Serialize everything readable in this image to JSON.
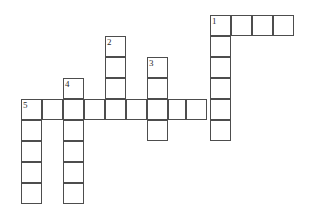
{
  "puzzle": {
    "title": "Crossword Grid",
    "grid": {
      "cell_size": 21,
      "origin_x": 21,
      "origin_y": 15,
      "columns": 14,
      "rows": 10,
      "border_color": "#4d4d4d",
      "cell_fill": "#ffffff",
      "background": "#ffffff",
      "number_color": "#2b2b2b"
    },
    "entries": [
      {
        "number": "1",
        "direction": "across",
        "start_col": 9,
        "start_row": 0,
        "length": 4
      },
      {
        "number": "1",
        "direction": "down",
        "start_col": 9,
        "start_row": 0,
        "length": 6
      },
      {
        "number": "2",
        "direction": "down",
        "start_col": 4,
        "start_row": 1,
        "length": 4
      },
      {
        "number": "3",
        "direction": "down",
        "start_col": 6,
        "start_row": 2,
        "length": 4
      },
      {
        "number": "4",
        "direction": "down",
        "start_col": 2,
        "start_row": 3,
        "length": 7
      },
      {
        "number": "5",
        "direction": "down",
        "start_col": 0,
        "start_row": 4,
        "length": 5
      },
      {
        "number": "5",
        "direction": "across",
        "start_col": 0,
        "start_row": 4,
        "length": 10
      }
    ],
    "cells": [
      {
        "col": 9,
        "row": 0,
        "w": 21,
        "number": "1"
      },
      {
        "col": 10,
        "row": 0,
        "w": 21,
        "number": ""
      },
      {
        "col": 11,
        "row": 0,
        "w": 21,
        "number": ""
      },
      {
        "col": 12,
        "row": 0,
        "w": 21,
        "number": ""
      },
      {
        "col": 4,
        "row": 1,
        "w": 21,
        "number": "2"
      },
      {
        "col": 9,
        "row": 1,
        "w": 21,
        "number": ""
      },
      {
        "col": 4,
        "row": 2,
        "w": 21,
        "number": ""
      },
      {
        "col": 6,
        "row": 2,
        "w": 21,
        "number": "3"
      },
      {
        "col": 9,
        "row": 2,
        "w": 21,
        "number": ""
      },
      {
        "col": 2,
        "row": 3,
        "w": 21,
        "number": "4"
      },
      {
        "col": 4,
        "row": 3,
        "w": 21,
        "number": ""
      },
      {
        "col": 6,
        "row": 3,
        "w": 21,
        "number": ""
      },
      {
        "col": 9,
        "row": 3,
        "w": 21,
        "number": ""
      },
      {
        "col": 0,
        "row": 4,
        "w": 21,
        "number": "5"
      },
      {
        "col": 1,
        "row": 4,
        "w": 21,
        "number": ""
      },
      {
        "col": 2,
        "row": 4,
        "w": 21,
        "number": ""
      },
      {
        "col": 3,
        "row": 4,
        "w": 21,
        "number": ""
      },
      {
        "col": 4,
        "row": 4,
        "w": 21,
        "number": ""
      },
      {
        "col": 5,
        "row": 4,
        "w": 21,
        "number": ""
      },
      {
        "col": 6,
        "row": 4,
        "w": 21,
        "number": ""
      },
      {
        "col": 7,
        "row": 4,
        "w": 18,
        "number": ""
      },
      {
        "col": 7.857,
        "row": 4,
        "w": 21,
        "number": ""
      },
      {
        "col": 9,
        "row": 4,
        "w": 21,
        "number": ""
      },
      {
        "col": 0,
        "row": 5,
        "w": 21,
        "number": ""
      },
      {
        "col": 2,
        "row": 5,
        "w": 21,
        "number": ""
      },
      {
        "col": 6,
        "row": 5,
        "w": 21,
        "number": ""
      },
      {
        "col": 9,
        "row": 5,
        "w": 21,
        "number": ""
      },
      {
        "col": 0,
        "row": 6,
        "w": 21,
        "number": ""
      },
      {
        "col": 2,
        "row": 6,
        "w": 21,
        "number": ""
      },
      {
        "col": 0,
        "row": 7,
        "w": 21,
        "number": ""
      },
      {
        "col": 2,
        "row": 7,
        "w": 21,
        "number": ""
      },
      {
        "col": 0,
        "row": 8,
        "w": 21,
        "number": ""
      },
      {
        "col": 2,
        "row": 8,
        "w": 21,
        "number": ""
      }
    ]
  }
}
